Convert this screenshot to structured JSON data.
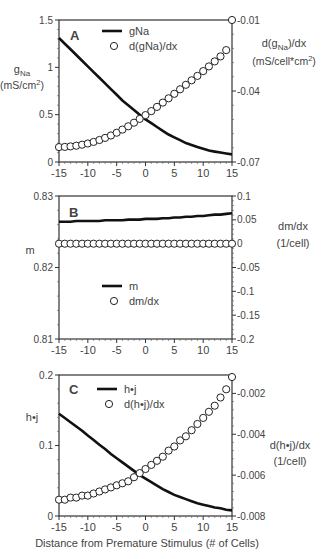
{
  "figure": {
    "xlabel": "Distance from Premature Stimulus (# of Cells)",
    "x_ticks": [
      -15,
      -10,
      -5,
      0,
      5,
      10,
      15
    ]
  },
  "chart_data": [
    {
      "type": "line",
      "panel": "A",
      "title": "A",
      "xlabel": "Distance from Premature Stimulus (# of Cells)",
      "x": [
        -15,
        -14,
        -13,
        -12,
        -11,
        -10,
        -9,
        -8,
        -7,
        -6,
        -5,
        -4,
        -3,
        -2,
        -1,
        0,
        1,
        2,
        3,
        4,
        5,
        6,
        7,
        8,
        9,
        10,
        11,
        12,
        13,
        14,
        15
      ],
      "xlim": [
        -15,
        15
      ],
      "left_axis": {
        "label_main": "g",
        "label_sub": "Na",
        "label_units": "(mS/cm",
        "label_units_sup": "2",
        "label_units_end": ")",
        "ylim": [
          0,
          1.5
        ],
        "ticks": [
          0,
          0.5,
          1,
          1.5
        ],
        "tick_labels": [
          "0",
          "0.5",
          "1",
          "1.5"
        ]
      },
      "right_axis": {
        "label_line1": "d(g",
        "label_line1_sub": "Na",
        "label_line1_end": ")/dx",
        "label_line2": "(mS/cell*cm",
        "label_line2_sup": "2",
        "label_line2_end": ")",
        "ylim": [
          -0.07,
          -0.01
        ],
        "ticks": [
          -0.07,
          -0.04,
          -0.01
        ],
        "tick_labels": [
          "-0.07",
          "-0.04",
          "-0.01"
        ]
      },
      "series": [
        {
          "name": "gNa",
          "style": "line",
          "axis": "left",
          "values": [
            1.31,
            1.25,
            1.19,
            1.13,
            1.07,
            1.01,
            0.95,
            0.89,
            0.83,
            0.77,
            0.71,
            0.65,
            0.6,
            0.55,
            0.5,
            0.45,
            0.41,
            0.37,
            0.33,
            0.29,
            0.26,
            0.23,
            0.2,
            0.18,
            0.16,
            0.14,
            0.12,
            0.11,
            0.1,
            0.09,
            0.08
          ]
        },
        {
          "name": "d(gNa)/dx",
          "style": "circles",
          "axis": "right",
          "values": [
            -0.0637,
            -0.0636,
            -0.0634,
            -0.0631,
            -0.0627,
            -0.0622,
            -0.0615,
            -0.0607,
            -0.0598,
            -0.0588,
            -0.0576,
            -0.0563,
            -0.0549,
            -0.0534,
            -0.0518,
            -0.0502,
            -0.0485,
            -0.0467,
            -0.0449,
            -0.0431,
            -0.0412,
            -0.0393,
            -0.0374,
            -0.0355,
            -0.0336,
            -0.0316,
            -0.0296,
            -0.0275,
            -0.0254,
            -0.0227,
            -0.01
          ]
        }
      ],
      "legend": {
        "position": "upper-center",
        "entries": [
          "gNa",
          "d(gNa)/dx"
        ]
      }
    },
    {
      "type": "line",
      "panel": "B",
      "title": "B",
      "xlabel": "Distance from Premature Stimulus (# of Cells)",
      "x": [
        -15,
        -14,
        -13,
        -12,
        -11,
        -10,
        -9,
        -8,
        -7,
        -6,
        -5,
        -4,
        -3,
        -2,
        -1,
        0,
        1,
        2,
        3,
        4,
        5,
        6,
        7,
        8,
        9,
        10,
        11,
        12,
        13,
        14,
        15
      ],
      "xlim": [
        -15,
        15
      ],
      "left_axis": {
        "label_main": "m",
        "ylim": [
          0.81,
          0.83
        ],
        "ticks": [
          0.81,
          0.82,
          0.83
        ],
        "tick_labels": [
          "0.81",
          "0.82",
          "0.83"
        ]
      },
      "right_axis": {
        "label_line1": "dm/dx",
        "label_line2": "(1/cell)",
        "ylim": [
          -0.2,
          0.1
        ],
        "ticks": [
          -0.2,
          -0.15,
          -0.1,
          -0.05,
          0,
          0.05,
          0.1
        ],
        "tick_labels": [
          "-0.2",
          "-0.15",
          "-0.1",
          "-0.05",
          "0",
          "0.05",
          "0.1"
        ]
      },
      "series": [
        {
          "name": "m",
          "style": "line",
          "axis": "left",
          "values": [
            0.8264,
            0.8264,
            0.8264,
            0.8265,
            0.8265,
            0.8265,
            0.8265,
            0.8265,
            0.8266,
            0.8266,
            0.8266,
            0.8266,
            0.8267,
            0.8267,
            0.8267,
            0.8268,
            0.8268,
            0.8268,
            0.8269,
            0.8269,
            0.827,
            0.827,
            0.8271,
            0.8271,
            0.8272,
            0.8272,
            0.8273,
            0.8274,
            0.8274,
            0.8275,
            0.8276
          ]
        },
        {
          "name": "dm/dx",
          "style": "circles",
          "axis": "right",
          "values": [
            0,
            0,
            0,
            0,
            0,
            0,
            0,
            0,
            0,
            0,
            0,
            0,
            0,
            0,
            0,
            0,
            0,
            0,
            0,
            0,
            0,
            0,
            0,
            0,
            0,
            0,
            0,
            0,
            0,
            0,
            0
          ]
        }
      ],
      "legend": {
        "position": "lower-center",
        "entries": [
          "m",
          "dm/dx"
        ]
      }
    },
    {
      "type": "line",
      "panel": "C",
      "title": "C",
      "xlabel": "Distance from Premature Stimulus (# of Cells)",
      "x": [
        -15,
        -14,
        -13,
        -12,
        -11,
        -10,
        -9,
        -8,
        -7,
        -6,
        -5,
        -4,
        -3,
        -2,
        -1,
        0,
        1,
        2,
        3,
        4,
        5,
        6,
        7,
        8,
        9,
        10,
        11,
        12,
        13,
        14,
        15
      ],
      "xlim": [
        -15,
        15
      ],
      "left_axis": {
        "label_main": "h•j",
        "ylim": [
          0,
          0.2
        ],
        "ticks": [
          0,
          0.1,
          0.2
        ],
        "tick_labels": [
          "0",
          "0.1",
          "0.2"
        ]
      },
      "right_axis": {
        "label_line1": "d(h•j)/dx",
        "label_line2": "(1/cell)",
        "ylim": [
          -0.008,
          -0.0011
        ],
        "ticks": [
          -0.008,
          -0.006,
          -0.004,
          -0.002
        ],
        "tick_labels": [
          "-0.008",
          "-0.006",
          "-0.004",
          "-0.002"
        ]
      },
      "series": [
        {
          "name": "h•j",
          "style": "line",
          "axis": "left",
          "values": [
            0.145,
            0.139,
            0.133,
            0.127,
            0.121,
            0.114,
            0.108,
            0.101,
            0.095,
            0.088,
            0.082,
            0.076,
            0.07,
            0.064,
            0.058,
            0.053,
            0.048,
            0.043,
            0.038,
            0.034,
            0.03,
            0.027,
            0.024,
            0.021,
            0.018,
            0.016,
            0.014,
            0.012,
            0.011,
            0.009,
            0.008
          ]
        },
        {
          "name": "d(h•j)/dx",
          "style": "circles",
          "axis": "right",
          "values": [
            -0.0072,
            -0.0072,
            -0.0071,
            -0.0071,
            -0.007,
            -0.007,
            -0.0069,
            -0.0068,
            -0.0067,
            -0.0066,
            -0.0065,
            -0.0064,
            -0.0063,
            -0.0061,
            -0.0059,
            -0.0057,
            -0.0055,
            -0.0053,
            -0.0051,
            -0.0048,
            -0.0046,
            -0.0043,
            -0.0041,
            -0.0038,
            -0.0035,
            -0.0032,
            -0.0029,
            -0.0026,
            -0.0022,
            -0.0018,
            -0.0012
          ]
        }
      ],
      "legend": {
        "position": "upper-center",
        "entries": [
          "h•j",
          "d(h•j)/dx"
        ]
      }
    }
  ]
}
